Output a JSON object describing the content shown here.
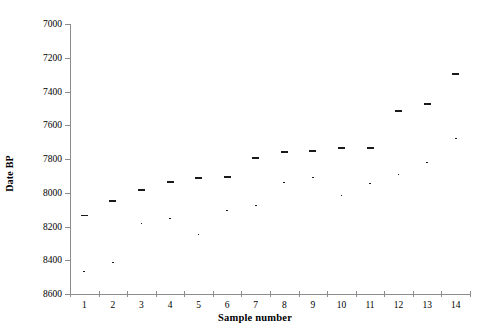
{
  "chart_data": {
    "type": "scatter",
    "title": "",
    "xlabel": "Sample number",
    "ylabel": "Date BP",
    "xlim": [
      0.5,
      14.5
    ],
    "ylim": [
      8600,
      7000
    ],
    "y_inverted": true,
    "grid": false,
    "legend": null,
    "y_ticks": [
      7000,
      7200,
      7400,
      7600,
      7800,
      8000,
      8200,
      8400,
      8600
    ],
    "x_ticks": [
      1,
      2,
      3,
      4,
      5,
      6,
      7,
      8,
      9,
      10,
      11,
      12,
      13,
      14
    ],
    "categories": [
      "1",
      "2",
      "3",
      "4",
      "5",
      "6",
      "7",
      "8",
      "9",
      "10",
      "11",
      "12",
      "13",
      "14"
    ],
    "series": [
      {
        "name": "Radiocarbon date with error range",
        "x": [
          1,
          2,
          3,
          4,
          5,
          6,
          7,
          8,
          9,
          10,
          11,
          12,
          13,
          14
        ],
        "values": [
          8130,
          8045,
          7980,
          7930,
          7905,
          7900,
          7790,
          7755,
          7745,
          7730,
          7730,
          7510,
          7470,
          7290
        ],
        "low": [
          7940,
          7700,
          7820,
          7735,
          7655,
          7750,
          7610,
          7570,
          7570,
          7450,
          7595,
          7310,
          7340,
          7130
        ],
        "high": [
          8465,
          8410,
          8180,
          8150,
          8245,
          8105,
          8070,
          7935,
          7905,
          8015,
          7940,
          7890,
          7820,
          7675
        ]
      }
    ]
  },
  "axis": {
    "y_label": "Date BP",
    "x_label": "Sample number"
  }
}
